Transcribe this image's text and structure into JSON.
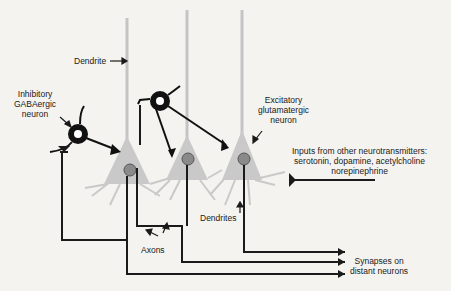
{
  "diagram": {
    "labels": {
      "dendrite_top": "Dendrite",
      "inhibitory": [
        "Inhibitory",
        "GABAergic",
        "neuron"
      ],
      "excitatory": [
        "Excitatory",
        "glutamatergic",
        "neuron"
      ],
      "inputs": [
        "Inputs from other neurotransmitters:",
        "serotonin, dopamine, acetylcholine",
        "norepinephrine"
      ],
      "dendrites_bottom": "Dendrites",
      "axons": "Axons",
      "synapses": [
        "Synapses on",
        "distant neurons"
      ]
    },
    "colors": {
      "background": "#f4f3f0",
      "neuron_body": "#c9c9c9",
      "nucleus": "#8a8a8a",
      "inhibitory": "#111111",
      "line": "#1a1a1a"
    }
  }
}
